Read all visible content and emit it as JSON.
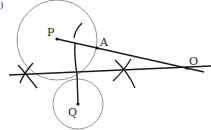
{
  "diagram": {
    "type": "geometric-construction",
    "points": [
      {
        "id": "P",
        "label": "P",
        "x": 57,
        "y": 39,
        "lx": 47,
        "ly": 36
      },
      {
        "id": "A",
        "label": "A",
        "x": 97,
        "y": 48,
        "lx": 100,
        "ly": 46
      },
      {
        "id": "O",
        "label": "O",
        "x": 187,
        "y": 68,
        "lx": 189,
        "ly": 65
      },
      {
        "id": "Q",
        "label": "Q",
        "x": 78,
        "y": 104,
        "lx": 68,
        "ly": 116
      }
    ],
    "circles": [
      {
        "id": "circle-P",
        "cx": 57,
        "cy": 40,
        "r": 40
      },
      {
        "id": "circle-Q",
        "cx": 78,
        "cy": 104,
        "r": 25
      }
    ],
    "lines": [
      {
        "id": "line-PO",
        "x1": 57,
        "y1": 39,
        "x2": 204,
        "y2": 72
      },
      {
        "id": "line-horizontal",
        "x1": 9,
        "y1": 75,
        "x2": 211,
        "y2": 66
      },
      {
        "id": "line-QM",
        "x1": 78,
        "y1": 104,
        "x2": 75,
        "y2": 43
      }
    ],
    "colors": {
      "stroke": "#1a1a1a",
      "circle": "#777777"
    },
    "corner_mark": ")"
  }
}
